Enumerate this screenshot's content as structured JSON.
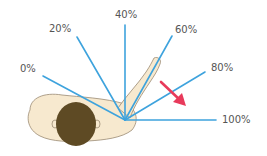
{
  "diagram": {
    "origin": {
      "x": 125,
      "y": 120
    },
    "line_color": "#3ea3dd",
    "arrow_color": "#e83a5b",
    "skin_color": "#f7e9cf",
    "skin_outline": "#9a8a74",
    "hair_color": "#5e4a24",
    "labels": [
      {
        "text": "0%",
        "x": 20,
        "y": 63
      },
      {
        "text": "20%",
        "x": 49,
        "y": 23
      },
      {
        "text": "40%",
        "x": 115,
        "y": 9
      },
      {
        "text": "60%",
        "x": 175,
        "y": 24
      },
      {
        "text": "80%",
        "x": 211,
        "y": 62
      },
      {
        "text": "100%",
        "x": 222,
        "y": 114
      }
    ],
    "lines": [
      {
        "name": "0%",
        "x2": 43,
        "y2": 76
      },
      {
        "name": "20%",
        "x2": 77,
        "y2": 37
      },
      {
        "name": "40%",
        "x2": 125,
        "y2": 25
      },
      {
        "name": "60%",
        "x2": 172,
        "y2": 36
      },
      {
        "name": "80%",
        "x2": 205,
        "y2": 72
      },
      {
        "name": "100%",
        "x2": 216,
        "y2": 120
      }
    ]
  }
}
